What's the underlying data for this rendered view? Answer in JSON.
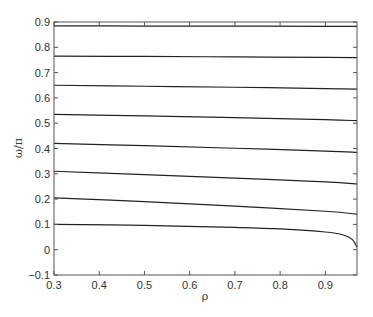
{
  "chart_data": {
    "type": "line",
    "title": "",
    "xlabel": "ρ",
    "ylabel": "ω/π",
    "xlim": [
      0.3,
      0.97
    ],
    "ylim": [
      -0.1,
      0.9
    ],
    "xticks": [
      0.3,
      0.4,
      0.5,
      0.6,
      0.7,
      0.8,
      0.9
    ],
    "xtick_labels": [
      "0.3",
      "0.4",
      "0.5",
      "0.6",
      "0.7",
      "0.8",
      "0.9"
    ],
    "yticks": [
      -0.1,
      0,
      0.1,
      0.2,
      0.3,
      0.4,
      0.5,
      0.6,
      0.7,
      0.8,
      0.9
    ],
    "ytick_labels": [
      "−0.1",
      "0",
      "0.1",
      "0.2",
      "0.3",
      "0.4",
      "0.5",
      "0.6",
      "0.7",
      "0.8",
      "0.9"
    ],
    "grid": false,
    "legend": null,
    "line_color": "#222222",
    "series": [
      {
        "name": "mode-8",
        "x": [
          0.3,
          0.5,
          0.7,
          0.9,
          0.97
        ],
        "y": [
          0.885,
          0.884,
          0.884,
          0.883,
          0.883
        ]
      },
      {
        "name": "mode-7",
        "x": [
          0.3,
          0.5,
          0.7,
          0.9,
          0.97
        ],
        "y": [
          0.765,
          0.764,
          0.762,
          0.76,
          0.759
        ]
      },
      {
        "name": "mode-6",
        "x": [
          0.3,
          0.5,
          0.7,
          0.9,
          0.97
        ],
        "y": [
          0.65,
          0.646,
          0.642,
          0.637,
          0.635
        ]
      },
      {
        "name": "mode-5",
        "x": [
          0.3,
          0.5,
          0.7,
          0.9,
          0.97
        ],
        "y": [
          0.535,
          0.529,
          0.522,
          0.514,
          0.51
        ]
      },
      {
        "name": "mode-4",
        "x": [
          0.3,
          0.5,
          0.7,
          0.9,
          0.97
        ],
        "y": [
          0.42,
          0.411,
          0.401,
          0.39,
          0.385
        ]
      },
      {
        "name": "mode-3",
        "x": [
          0.3,
          0.5,
          0.7,
          0.9,
          0.97
        ],
        "y": [
          0.31,
          0.297,
          0.283,
          0.268,
          0.26
        ]
      },
      {
        "name": "mode-2",
        "x": [
          0.3,
          0.5,
          0.7,
          0.9,
          0.97
        ],
        "y": [
          0.205,
          0.19,
          0.172,
          0.152,
          0.14
        ]
      },
      {
        "name": "mode-1",
        "x": [
          0.3,
          0.5,
          0.7,
          0.8,
          0.9,
          0.94,
          0.96,
          0.97
        ],
        "y": [
          0.1,
          0.096,
          0.088,
          0.082,
          0.07,
          0.058,
          0.04,
          0.01
        ]
      }
    ]
  }
}
